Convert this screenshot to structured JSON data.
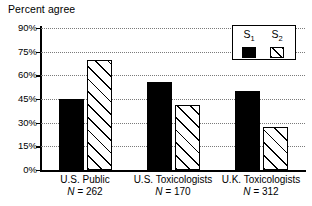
{
  "chart_data": {
    "type": "bar",
    "title": "Percent agree",
    "xlabel": "",
    "ylabel": "Percent agree",
    "ylim": [
      0,
      90
    ],
    "yticks": [
      "0%",
      "15%",
      "30%",
      "45%",
      "60%",
      "75%",
      "90%"
    ],
    "ytick_values": [
      0,
      15,
      30,
      45,
      60,
      75,
      90
    ],
    "grid": true,
    "grid_style": "dotted-horizontal",
    "legend_position": "top-right",
    "categories": [
      "U.S. Public",
      "U.S. Toxicologists",
      "U.K. Toxicologists"
    ],
    "category_sublabels": [
      "N = 262",
      "N = 170",
      "N = 312"
    ],
    "sample_sizes": [
      262,
      170,
      312
    ],
    "series": [
      {
        "name": "S1",
        "label": "S",
        "subscript": "1",
        "fill": "solid-black",
        "color": "#000000",
        "values": [
          45,
          56,
          50
        ]
      },
      {
        "name": "S2",
        "label": "S",
        "subscript": "2",
        "fill": "diagonal-hatch",
        "color": "#000000",
        "values": [
          70,
          41,
          27
        ]
      }
    ]
  },
  "legend": {
    "entries": [
      {
        "label": "S",
        "subscript": "1",
        "swatch": "solid-black-swatch"
      },
      {
        "label": "S",
        "subscript": "2",
        "swatch": "hatched-swatch"
      }
    ]
  }
}
